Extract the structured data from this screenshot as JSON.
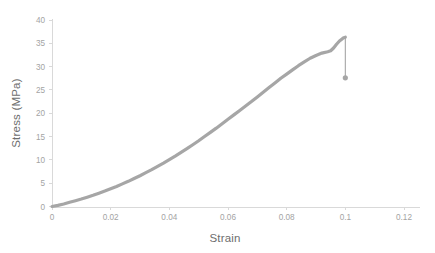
{
  "chart_data": {
    "type": "line",
    "title": "",
    "xlabel": "Strain",
    "ylabel": "Stress (MPa)",
    "xlim": [
      0,
      0.12
    ],
    "ylim": [
      0,
      40
    ],
    "grid": false,
    "legend": false,
    "legend_position": "none",
    "line_color": "#a6a6a6",
    "axis_color": "#d9d9d9",
    "tick_label_color": "#a3a3a3",
    "axis_title_color": "#6e6e6e",
    "xticks": [
      "0",
      "0.02",
      "0.04",
      "0.06",
      "0.08",
      "0.1",
      "0.12"
    ],
    "xtick_values": [
      0,
      0.02,
      0.04,
      0.06,
      0.08,
      0.1,
      0.12
    ],
    "yticks": [
      "0",
      "5",
      "10",
      "15",
      "20",
      "25",
      "30",
      "35",
      "40"
    ],
    "ytick_values": [
      0,
      5,
      10,
      15,
      20,
      25,
      30,
      35,
      40
    ],
    "series": [
      {
        "name": "Stress-Strain",
        "x": [
          0,
          0.002,
          0.004,
          0.006,
          0.008,
          0.01,
          0.012,
          0.014,
          0.016,
          0.018,
          0.02,
          0.022,
          0.024,
          0.026,
          0.028,
          0.03,
          0.032,
          0.034,
          0.036,
          0.038,
          0.04,
          0.042,
          0.044,
          0.046,
          0.048,
          0.05,
          0.052,
          0.054,
          0.056,
          0.058,
          0.06,
          0.062,
          0.064,
          0.066,
          0.068,
          0.07,
          0.072,
          0.074,
          0.076,
          0.078,
          0.08,
          0.082,
          0.084,
          0.086,
          0.088,
          0.09,
          0.092,
          0.094,
          0.095,
          0.096,
          0.097,
          0.098,
          0.099,
          0.0995,
          0.1
        ],
        "y": [
          0.0,
          0.25,
          0.55,
          0.9,
          1.25,
          1.6,
          2.0,
          2.4,
          2.85,
          3.3,
          3.8,
          4.3,
          4.85,
          5.4,
          6.0,
          6.6,
          7.25,
          7.9,
          8.6,
          9.3,
          10.05,
          10.8,
          11.6,
          12.4,
          13.25,
          14.1,
          15.0,
          15.9,
          16.8,
          17.75,
          18.7,
          19.65,
          20.6,
          21.55,
          22.5,
          23.5,
          24.5,
          25.5,
          26.5,
          27.5,
          28.4,
          29.3,
          30.2,
          31.0,
          31.8,
          32.4,
          32.9,
          33.2,
          33.4,
          34.0,
          34.8,
          35.5,
          36.0,
          36.2,
          36.3
        ]
      }
    ],
    "annotations": [
      {
        "name": "fracture-drop",
        "type": "vertical-drop-with-marker",
        "x": 0.1,
        "y_start": 36.3,
        "y_end": 27.6,
        "marker": "circle"
      }
    ]
  }
}
